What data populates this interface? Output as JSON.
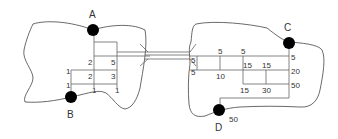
{
  "diagram": {
    "type": "two-region circuit / network diagram",
    "nodes": [
      {
        "id": "A",
        "label": "A",
        "region": "left"
      },
      {
        "id": "B",
        "label": "B",
        "region": "left"
      },
      {
        "id": "C",
        "label": "C",
        "region": "right"
      },
      {
        "id": "D",
        "label": "D",
        "region": "right"
      }
    ],
    "left_labels": [
      "2",
      "5",
      "1",
      "2",
      "3",
      "1",
      "1",
      "1"
    ],
    "right_labels": [
      "5",
      "5",
      "5",
      "5",
      "10",
      "15",
      "15",
      "5",
      "20",
      "15",
      "30",
      "50",
      "50"
    ],
    "labels": {
      "A": "A",
      "B": "B",
      "C": "C",
      "D": "D",
      "l_2a": "2",
      "l_5": "5",
      "l_1a": "1",
      "l_2b": "2",
      "l_3": "3",
      "l_1b": "1",
      "l_1c": "1",
      "l_1d": "1",
      "r_5a": "5",
      "r_5b": "5",
      "r_5c": "5",
      "r_5d": "5",
      "r_10": "10",
      "r_15a": "15",
      "r_15b": "15",
      "r_5e": "5",
      "r_20": "20",
      "r_15c": "15",
      "r_30": "30",
      "r_50": "50",
      "r_50d": "50"
    },
    "colors": {
      "stroke": "#666666",
      "node": "#000000",
      "text": "#333333"
    }
  }
}
